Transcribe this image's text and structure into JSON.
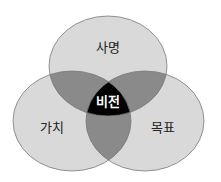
{
  "diagram": {
    "type": "venn",
    "sets": [
      {
        "id": "mission",
        "label": "사명",
        "cx": 108,
        "cy": 66,
        "rx": 59,
        "ry": 50
      },
      {
        "id": "value",
        "label": "가치",
        "cx": 72,
        "cy": 121,
        "rx": 59,
        "ry": 50
      },
      {
        "id": "goal",
        "label": "목표",
        "cx": 145,
        "cy": 121,
        "rx": 59,
        "ry": 50
      }
    ],
    "center": {
      "label": "비전"
    },
    "colors": {
      "single": "#d9d9d9",
      "pair": "#8a8a8a",
      "triple": "#000000",
      "stroke": "#7a7a7a",
      "center_text": "#ffffff",
      "label_text": "#222222"
    }
  }
}
